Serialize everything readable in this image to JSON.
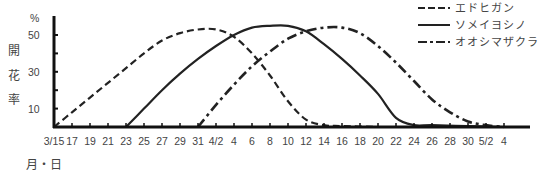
{
  "chart_data": {
    "type": "line",
    "title": "",
    "xlabel": "月・日",
    "ylabel": "開花率",
    "yunit": "%",
    "ylim": [
      0,
      58
    ],
    "yticks": [
      10,
      20,
      30,
      40,
      50
    ],
    "ytick_labels": [
      "10",
      "30",
      "50"
    ],
    "x_tick_labels": [
      "3/15",
      "17",
      "19",
      "21",
      "23",
      "25",
      "27",
      "29",
      "31",
      "4/2",
      "4",
      "6",
      "8",
      "10",
      "12",
      "14",
      "16",
      "18",
      "20",
      "22",
      "24",
      "26",
      "28",
      "30",
      "5/2",
      "4"
    ],
    "x_unit": "days since 3/15",
    "grid": false,
    "legend_position": "top-right",
    "series": [
      {
        "name": "エドヒガン",
        "style": "dashed",
        "points": [
          [
            0,
            0
          ],
          [
            2,
            8
          ],
          [
            4,
            16
          ],
          [
            6,
            24
          ],
          [
            8,
            32
          ],
          [
            10,
            40
          ],
          [
            12,
            47
          ],
          [
            14,
            51
          ],
          [
            16,
            53
          ],
          [
            18,
            53
          ],
          [
            20,
            49
          ],
          [
            22,
            40
          ],
          [
            24,
            28
          ],
          [
            26,
            14
          ],
          [
            28,
            4
          ],
          [
            30,
            1
          ],
          [
            32,
            0.5
          ],
          [
            36,
            0
          ]
        ]
      },
      {
        "name": "ソメイヨシノ",
        "style": "solid",
        "points": [
          [
            8,
            0
          ],
          [
            10,
            10
          ],
          [
            12,
            20
          ],
          [
            14,
            29
          ],
          [
            16,
            37
          ],
          [
            18,
            44
          ],
          [
            20,
            50
          ],
          [
            22,
            54
          ],
          [
            24,
            55
          ],
          [
            26,
            55
          ],
          [
            28,
            52
          ],
          [
            30,
            45
          ],
          [
            32,
            37
          ],
          [
            34,
            28
          ],
          [
            36,
            18
          ],
          [
            38,
            5
          ],
          [
            40,
            1
          ],
          [
            42,
            1
          ],
          [
            46,
            0.5
          ],
          [
            50,
            0
          ]
        ]
      },
      {
        "name": "オオシマザクラ",
        "style": "dash-dot",
        "points": [
          [
            16,
            0
          ],
          [
            18,
            12
          ],
          [
            20,
            23
          ],
          [
            22,
            33
          ],
          [
            24,
            41
          ],
          [
            26,
            48
          ],
          [
            28,
            52
          ],
          [
            30,
            54
          ],
          [
            32,
            54
          ],
          [
            34,
            51
          ],
          [
            36,
            44
          ],
          [
            38,
            35
          ],
          [
            40,
            25
          ],
          [
            42,
            15
          ],
          [
            44,
            8
          ],
          [
            46,
            3
          ],
          [
            48,
            1
          ],
          [
            50,
            0
          ]
        ]
      }
    ]
  },
  "legend": {
    "items": [
      {
        "label": "エドヒガン",
        "style": "dashed"
      },
      {
        "label": "ソメイヨシノ",
        "style": "solid"
      },
      {
        "label": "オオシマザクラ",
        "style": "dash-dot"
      }
    ]
  },
  "axes": {
    "y_unit_label": "%",
    "y_title_chars": [
      "開",
      "花",
      "率"
    ],
    "x_title": "月・日"
  }
}
